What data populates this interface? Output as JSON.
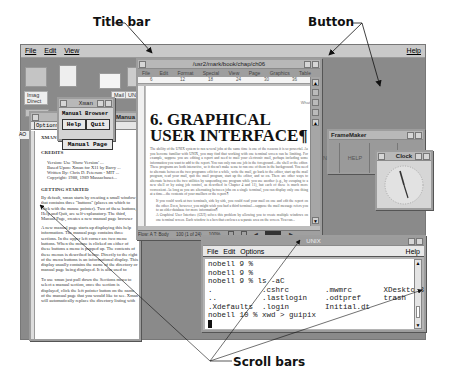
{
  "callouts": {
    "title_bar": "Title bar",
    "button": "Button",
    "scroll_bars": "Scroll bars"
  },
  "desktop": {
    "menu": [
      "File",
      "Edit",
      "View"
    ],
    "help": "Help",
    "icons": [
      {
        "label": "Imag\nDirect"
      },
      {
        "label": "Mail"
      },
      {
        "label": "UN"
      }
    ]
  },
  "xman": {
    "title": "Xman",
    "heading": "Manual Browser",
    "buttons": {
      "help": "Help",
      "quit": "Quit",
      "manual_page": "Manual Page"
    }
  },
  "manpage": {
    "title": "Manua",
    "menu": [
      "Options",
      "Sections"
    ],
    "side_label": "AO",
    "intro": "XMAN is an X Window System ...",
    "credits_heading": "CREDITS",
    "credits": [
      "Version:   Use 'Show Version' ...",
      "Based Upon: Xman for X11 by Barry ...",
      "Written By: Chris D. Peterson - MIT ...",
      "Copyright: 1988, 1989 Massachuset..."
    ],
    "getting_started_heading": "GETTING STARTED",
    "para1": "By default, xman starts by creating a small window that contains three \"buttons\" (places on which to click with the mouse pointer). Two of these buttons, Help and Quit, are self-explanatory. The third, Manual Page, creates a new manual page browser window; you may use this button to open a new manual page any time xman is running.",
    "para2": "A new manual page starts up displaying this help information. The manual page contains three sections. In the upper left corner are two menu buttons. When the mouse is clicked on either of these buttons a menu is popped up. The contents of these menus is described below. Directly to the right of the menu buttons is an informational display. This display usually contains the name of the directory or manual page being displayed. It is also used to display warning messages and the current version of xman. The last and largest section is the information display. This section of the application contains either a list of manual pages to choose from, or the text of a manual page.",
    "para3": "To use xman just pull down the Sections menu to select a manual section, once the section is displayed, click the left pointer button on the name of the manual page that you would like to see. Xman will automatically replace the directory listing with the manual page you have selected."
  },
  "framemaker_doc": {
    "title": "/usr2/mark/book/chap/ch06",
    "menu": [
      "File",
      "Edit",
      "Format",
      "Special",
      "View",
      "Page",
      "Graphics",
      "Table"
    ],
    "ruler": [
      "6",
      "12",
      "18",
      "24",
      "30",
      "36"
    ],
    "heading": "6. GRAPHICAL USER INTERFACE¶",
    "para1": "The ability of the UNIX system to run several jobs at the same time is one of the reasons it is so powerful. As you become familiar with UNIX, you may find that working with one terminal screen can be limiting. For example, suppose you are editing a report and need to mail your electronic mail, perhaps including some information you want to add to the report. You can only run one job in the foreground—the shell or the editor. These programs are both interactive, so it doesn't make sense to run one of them in the background. You need to alternate between the two programs: edit for a while, write the mail, go back to the editor, start up the mail program, read your mail, quit the mail program, start up the editor, and so on. There are other ways to alternate between the two utilities by suspending one program while you use another (e.g., by escaping to a new shell or by using job control, as described in Chapter 4 and 11), but each of these is much more convenient. As long as you are alternating between jobs on a single terminal, you can display only one thing at a time—the contents of your mailbox or the report.¶",
    "para2": "If you could work at two terminals, side by side, you could read your mail on one and edit the report on the other. Even, however, you might wish you had a third terminal—suppose the mail message refers you to an older database for more information¶",
    "para3": "A Graphical User Interface (GUI) solves this problem by allowing you to create multiple windows on one terminal screen. Each window is a box that encloses a separate area on the screen. You can...",
    "status": {
      "flow": "Flow: A  T: Body",
      "page": "100 (1 of 24)",
      "zoom": "100%"
    }
  },
  "framemaker_panel": {
    "title": "FrameMaker",
    "buttons": [
      "N",
      "HELP",
      "INFO",
      "EXIT"
    ],
    "what_label": "What"
  },
  "clock": {
    "title": "Clock"
  },
  "unix_terminal": {
    "title": "UNIX",
    "menu": [
      "File",
      "Edit",
      "Options"
    ],
    "help": "Help",
    "lines": [
      "nobell 9 %",
      "nobell 9 %",
      "nobell 9 % ls -aC",
      ".           .cshrc        .mwmrc       XDesktop3",
      "..          .lastlogin    .odtpref     trash",
      ".Xdefaults  .login        Initial.dt",
      "nobell 10 % xwd > guipix"
    ]
  }
}
